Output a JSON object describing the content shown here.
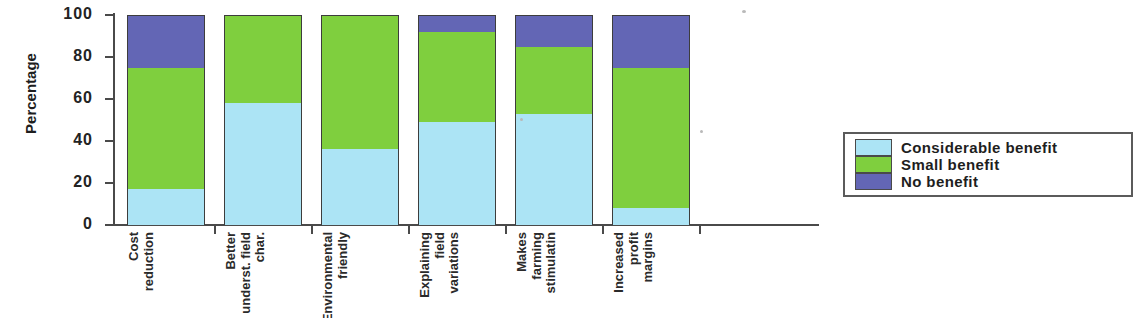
{
  "chart_data": {
    "type": "bar",
    "subtype": "100% stacked column",
    "title": "",
    "xlabel": "",
    "ylabel": "Percentage",
    "ylim": [
      0,
      100
    ],
    "yticks": [
      0,
      20,
      40,
      60,
      80,
      100
    ],
    "ytick_labels": [
      "0",
      "20",
      "40",
      "60",
      "80",
      "100"
    ],
    "grid": false,
    "legend_position": "right",
    "categories": [
      "Cost reduction",
      "Better underst. field char.",
      "Environmental friendly",
      "Explaining field variations",
      "Makes farming stimulatin",
      "Increased profit margins"
    ],
    "category_lines": [
      [
        "Cost",
        "reduction"
      ],
      [
        "Better",
        "underst. field",
        "char."
      ],
      [
        "Environmental",
        "friendly"
      ],
      [
        "Explaining",
        "field",
        "variations"
      ],
      [
        "Makes",
        "farming",
        "stimulatin"
      ],
      [
        "Increased",
        "profit",
        "margins"
      ]
    ],
    "series": [
      {
        "name": "Considerable benefit",
        "color": "#ace4f5",
        "values": [
          17,
          58,
          36,
          49,
          53,
          8
        ]
      },
      {
        "name": "Small benefit",
        "color": "#7fcf3e",
        "values": [
          58,
          42,
          64,
          43,
          32,
          67
        ]
      },
      {
        "name": "No benefit",
        "color": "#6366b5",
        "values": [
          25,
          0,
          0,
          8,
          15,
          25
        ]
      }
    ]
  },
  "legend": {
    "items": [
      {
        "label": "Considerable benefit",
        "color": "#ace4f5"
      },
      {
        "label": "Small benefit",
        "color": "#7fcf3e"
      },
      {
        "label": "No benefit",
        "color": "#6366b5"
      }
    ]
  },
  "axis": {
    "y_title": "Percentage"
  }
}
